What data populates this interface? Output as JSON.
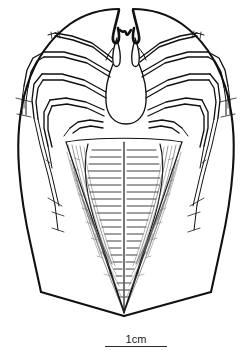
{
  "figure": {
    "kind": "scientific-line-drawing",
    "background_color": "#ffffff",
    "ink_color": "#111111",
    "shading_color": "#3a3a3a",
    "width_px": 248,
    "height_px": 359
  },
  "scale_bar": {
    "label": "1cm",
    "rule_color": "#2b2b2b",
    "length_px": 62
  },
  "anatomy": {
    "carapace": "carapace-outline",
    "chelicerae": "chelicerae",
    "sternum": "sternum-plate",
    "abdomen": "striated-abdomen",
    "legs_left": [
      "leg-left-1",
      "leg-left-2",
      "leg-left-3",
      "leg-left-4"
    ],
    "legs_right": [
      "leg-right-1",
      "leg-right-2",
      "leg-right-3",
      "leg-right-4"
    ]
  }
}
